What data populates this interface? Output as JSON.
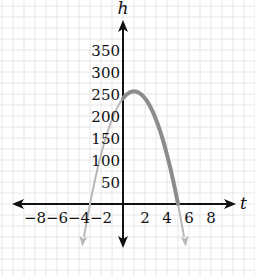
{
  "chart_data": {
    "type": "line",
    "title": "",
    "xlabel": "t",
    "ylabel": "h",
    "x_ticks": [
      -8,
      -6,
      -4,
      -2,
      2,
      4,
      6,
      8
    ],
    "y_ticks": [
      50,
      100,
      150,
      200,
      250,
      300,
      350
    ],
    "x_tick_labels": [
      "−8",
      "−6",
      "−4",
      "−2",
      "2",
      "4",
      "6",
      "8"
    ],
    "y_tick_labels": [
      "50",
      "100",
      "150",
      "200",
      "250",
      "300",
      "350"
    ],
    "xlim": [
      -9,
      9
    ],
    "ylim": [
      -150,
      400
    ],
    "grid": true,
    "series": [
      {
        "name": "h = -16t^2 + 32t + 240 (domain)",
        "color": "#8c8c8c",
        "x": [
          0,
          1,
          2,
          3,
          4,
          5
        ],
        "values": [
          240,
          256,
          240,
          192,
          112,
          0
        ]
      },
      {
        "name": "h = -16t^2 + 32t + 240 (extended)",
        "color": "#b8b8b8",
        "x": [
          -3.7,
          -3,
          -2,
          -1,
          0,
          5,
          5.7
        ],
        "values": [
          -90,
          0,
          112,
          192,
          240,
          0,
          -90
        ]
      }
    ],
    "annotations": {
      "vertex": [
        1,
        256
      ],
      "roots": [
        -3,
        5
      ]
    }
  }
}
